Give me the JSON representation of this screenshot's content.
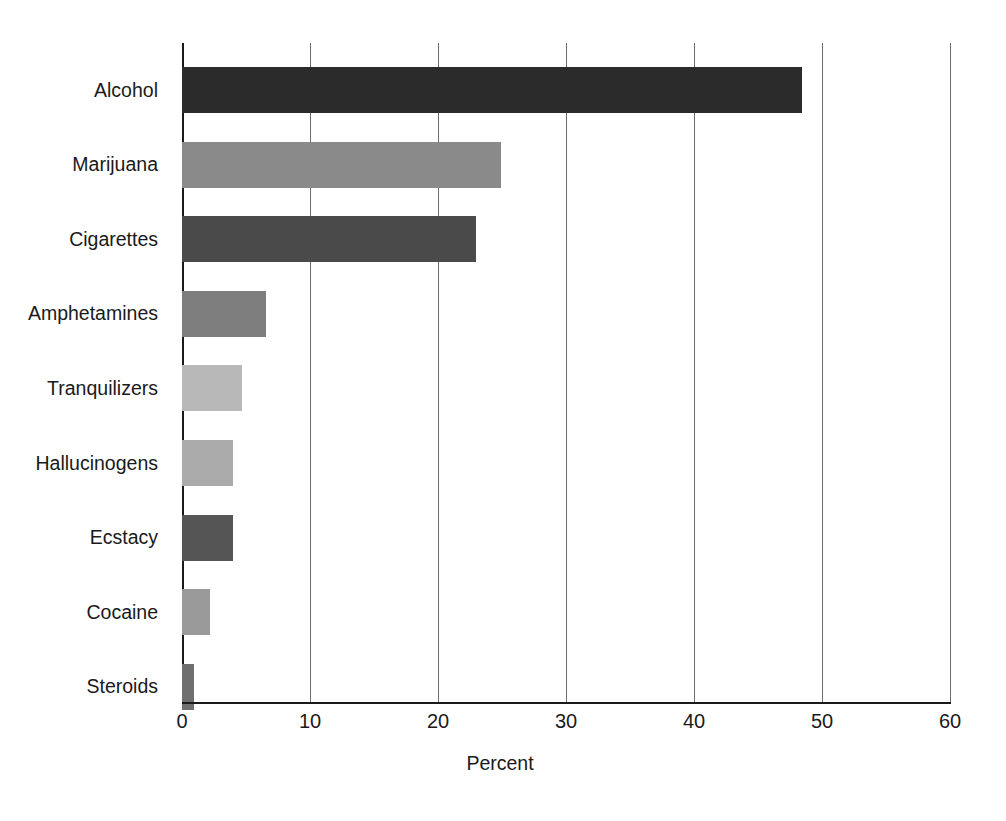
{
  "chart_data": {
    "type": "bar",
    "orientation": "horizontal",
    "title": "",
    "subtitle": "",
    "xlabel": "Percent",
    "ylabel": "",
    "xlim": [
      0,
      60
    ],
    "xticks": [
      "0",
      "10",
      "20",
      "30",
      "40",
      "50",
      "60"
    ],
    "xtick_values": [
      0,
      10,
      20,
      30,
      40,
      50,
      60
    ],
    "grid": "vertical",
    "legend": "none",
    "categories": [
      "Alcohol",
      "Marijuana",
      "Cigarettes",
      "Amphetamines",
      "Tranquilizers",
      "Hallucinogens",
      "Ecstacy",
      "Cocaine",
      "Steroids"
    ],
    "values": [
      48.4,
      24.9,
      23.0,
      6.6,
      4.7,
      4.0,
      4.0,
      2.2,
      0.9
    ],
    "bar_colors": [
      "#2b2b2b",
      "#8a8a8a",
      "#4a4a4a",
      "#7e7e7e",
      "#b8b8b8",
      "#ababab",
      "#555555",
      "#9a9a9a",
      "#6f6f6f"
    ],
    "bars": [
      {
        "label": "Alcohol",
        "value": 48.4,
        "color": "#2b2b2b"
      },
      {
        "label": "Marijuana",
        "value": 24.9,
        "color": "#8a8a8a"
      },
      {
        "label": "Cigarettes",
        "value": 23.0,
        "color": "#4a4a4a"
      },
      {
        "label": "Amphetamines",
        "value": 6.6,
        "color": "#7e7e7e"
      },
      {
        "label": "Tranquilizers",
        "value": 4.7,
        "color": "#b8b8b8"
      },
      {
        "label": "Hallucinogens",
        "value": 4.0,
        "color": "#ababab"
      },
      {
        "label": "Ecstacy",
        "value": 4.0,
        "color": "#555555"
      },
      {
        "label": "Cocaine",
        "value": 2.2,
        "color": "#9a9a9a"
      },
      {
        "label": "Steroids",
        "value": 0.9,
        "color": "#6f6f6f"
      }
    ]
  },
  "colors": {
    "background": "#ffffff",
    "axis": "#1a1a1a",
    "gridline": "#6b6b6b",
    "text": "#1a1a1a"
  }
}
